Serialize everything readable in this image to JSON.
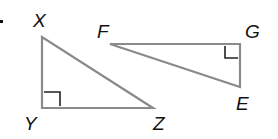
{
  "diagram": {
    "type": "geometry-triangles",
    "bullet": "•",
    "triangles": [
      {
        "name": "XYZ",
        "right_angle_at": "Y",
        "vertices": {
          "X": {
            "label": "X",
            "x": 42,
            "y": 37
          },
          "Y": {
            "label": "Y",
            "x": 42,
            "y": 108
          },
          "Z": {
            "label": "Z",
            "x": 153,
            "y": 108
          }
        }
      },
      {
        "name": "FGE",
        "right_angle_at": "G",
        "vertices": {
          "F": {
            "label": "F",
            "x": 110,
            "y": 44
          },
          "G": {
            "label": "G",
            "x": 240,
            "y": 44
          },
          "E": {
            "label": "E",
            "x": 240,
            "y": 87
          }
        }
      }
    ],
    "labels": {
      "X": "X",
      "Y": "Y",
      "Z": "Z",
      "F": "F",
      "G": "G",
      "E": "E"
    },
    "colors": {
      "edge": "#8a8a8a",
      "right_angle_mark": "#222222",
      "text": "#111111"
    }
  }
}
